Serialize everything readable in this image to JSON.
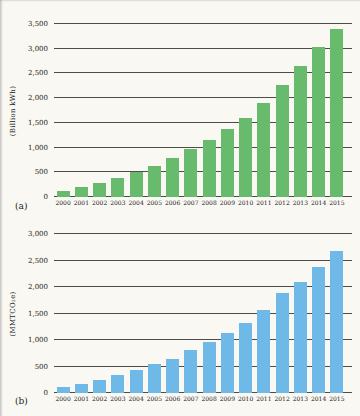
{
  "figure": {
    "background": "#f9f8f3",
    "gridline_color": "#4d4d4d"
  },
  "chart_data": [
    {
      "id": "a",
      "type": "bar",
      "panel_label": "(a)",
      "ylabel": "(Billion kWh)",
      "xlabel": "",
      "ylim": [
        0,
        3500
      ],
      "ytick_step": 500,
      "yticks": [
        "0",
        "500",
        "1,000",
        "1,500",
        "2,000",
        "2,500",
        "3,000",
        "3,500"
      ],
      "grid": true,
      "legend": "none",
      "bar_color": "#68bb6d",
      "categories": [
        "2000",
        "2001",
        "2002",
        "2003",
        "2004",
        "2005",
        "2006",
        "2007",
        "2008",
        "2009",
        "2010",
        "2011",
        "2012",
        "2013",
        "2014",
        "2015"
      ],
      "values": [
        120,
        200,
        280,
        390,
        500,
        620,
        790,
        980,
        1160,
        1380,
        1600,
        1900,
        2270,
        2660,
        3030,
        3390
      ]
    },
    {
      "id": "b",
      "type": "bar",
      "panel_label": "(b)",
      "ylabel": "(MMTCO₂e)",
      "xlabel": "",
      "ylim": [
        0,
        3000
      ],
      "ytick_step": 500,
      "yticks": [
        "0",
        "500",
        "1,000",
        "1,500",
        "2,000",
        "2,500",
        "3,000"
      ],
      "grid": true,
      "legend": "none",
      "bar_color": "#6fb9e9",
      "categories": [
        "2000",
        "2001",
        "2002",
        "2003",
        "2004",
        "2005",
        "2006",
        "2007",
        "2008",
        "2009",
        "2010",
        "2011",
        "2012",
        "2013",
        "2014",
        "2015"
      ],
      "values": [
        110,
        175,
        250,
        345,
        435,
        555,
        650,
        805,
        965,
        1130,
        1330,
        1565,
        1885,
        2100,
        2380,
        2675
      ]
    }
  ]
}
